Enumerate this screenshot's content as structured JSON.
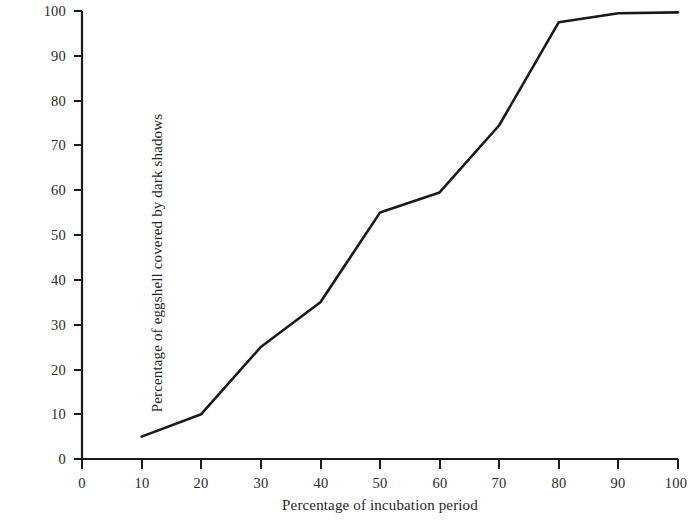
{
  "chart_data": {
    "type": "line",
    "title": "",
    "subtitle": "",
    "xlabel": "Percentage of incubation period",
    "ylabel": "Percentage of eggshell covered by dark shadows",
    "x": [
      10,
      20,
      30,
      40,
      50,
      60,
      70,
      80,
      90,
      100
    ],
    "values": [
      5,
      10,
      25,
      35,
      55,
      59.5,
      74.5,
      97.5,
      99.5,
      99.7
    ],
    "series": [
      {
        "name": "Eggshell dark shadow coverage",
        "x": [
          10,
          20,
          30,
          40,
          50,
          60,
          70,
          80,
          90,
          100
        ],
        "values": [
          5,
          10,
          25,
          35,
          55,
          59.5,
          74.5,
          97.5,
          99.5,
          99.7
        ]
      }
    ],
    "xlim": [
      0,
      100
    ],
    "ylim": [
      0,
      100
    ],
    "xticks": [
      0,
      10,
      20,
      30,
      40,
      50,
      60,
      70,
      80,
      90,
      100
    ],
    "yticks": [
      0,
      10,
      20,
      30,
      40,
      50,
      60,
      70,
      80,
      90,
      100
    ],
    "xtick_labels": [
      "0",
      "10",
      "20",
      "30",
      "40",
      "50",
      "60",
      "70",
      "80",
      "90",
      "100"
    ],
    "ytick_labels": [
      "0",
      "10",
      "20",
      "30",
      "40",
      "50",
      "60",
      "70",
      "80",
      "90",
      "100"
    ],
    "grid": false,
    "legend": false,
    "legend_position": "none",
    "line_color": "#1a1a1a",
    "background_color": "#ffffff",
    "axis_color": "#1a1a1a",
    "annotations": []
  }
}
